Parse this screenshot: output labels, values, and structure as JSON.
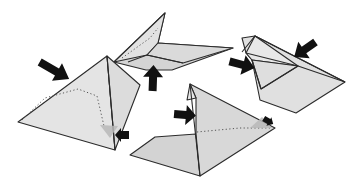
{
  "diagram": {
    "title": "Origami folding steps",
    "colors": {
      "paper_light": "#e6e6e6",
      "paper_mid": "#d6d6d6",
      "paper_dark": "#c9c9c9",
      "outline": "#2b2b2b",
      "arrow": "#111111",
      "ghost_arrow": "#b9b9b9",
      "background": "#ffffff"
    },
    "figures": [
      {
        "id": "figure-left-pyramid",
        "label": "Pyramid view with dotted fold line"
      },
      {
        "id": "figure-top-flat",
        "label": "Flattened wing view"
      },
      {
        "id": "figure-right-boat",
        "label": "Boat-shaped view"
      },
      {
        "id": "figure-bottom-open",
        "label": "Opened view with dotted crease"
      }
    ],
    "arrows": [
      {
        "id": "arrow-left-push",
        "type": "push",
        "color": "#111111"
      },
      {
        "id": "arrow-left-small",
        "type": "push",
        "color": "#111111"
      },
      {
        "id": "arrow-top-up",
        "type": "push",
        "color": "#111111"
      },
      {
        "id": "arrow-right-left",
        "type": "push",
        "color": "#111111"
      },
      {
        "id": "arrow-right-top",
        "type": "push",
        "color": "#111111"
      },
      {
        "id": "arrow-bottom-left",
        "type": "push",
        "color": "#111111"
      },
      {
        "id": "arrow-bottom-right",
        "type": "push",
        "color": "#111111"
      }
    ]
  }
}
